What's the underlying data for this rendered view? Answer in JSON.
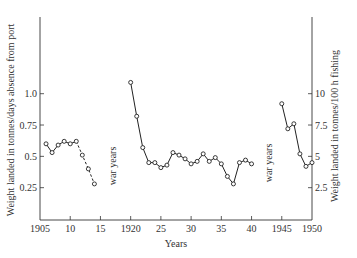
{
  "chart_data": {
    "type": "line",
    "title": "",
    "xlabel": "Years",
    "ylabel": "Weight landed in tonnes/days absence from port",
    "ylabel_right": "Weight landed in tonnes/100 h fishing",
    "xlim": [
      1905,
      1950
    ],
    "ylim": [
      0,
      1.3
    ],
    "ylim_right": [
      0,
      13
    ],
    "grid": false,
    "legend": null,
    "x_ticks": [
      {
        "value": 1905,
        "label": "1905"
      },
      {
        "value": 1910,
        "label": "10"
      },
      {
        "value": 1915,
        "label": "15"
      },
      {
        "value": 1920,
        "label": "1920"
      },
      {
        "value": 1925,
        "label": "25"
      },
      {
        "value": 1930,
        "label": "30"
      },
      {
        "value": 1935,
        "label": "35"
      },
      {
        "value": 1940,
        "label": "40"
      },
      {
        "value": 1945,
        "label": "1945"
      },
      {
        "value": 1950,
        "label": "1950"
      }
    ],
    "y_ticks_left": [
      {
        "value": 0.25,
        "label": "0.25"
      },
      {
        "value": 0.5,
        "label": "0.5"
      },
      {
        "value": 0.75,
        "label": "0.75"
      },
      {
        "value": 1.0,
        "label": "1.0"
      }
    ],
    "y_ticks_right": [
      {
        "value": 2.5,
        "label": "2.5"
      },
      {
        "value": 5,
        "label": "5"
      },
      {
        "value": 7.5,
        "label": "7.5"
      },
      {
        "value": 10,
        "label": "10"
      }
    ],
    "annotations": [
      {
        "text": "war years",
        "x": 1916.5,
        "y": 0.35,
        "rotation": -90
      },
      {
        "text": "war years",
        "x": 1942.5,
        "y": 0.5,
        "rotation": -90
      }
    ],
    "series": [
      {
        "name": "1906-1914 (tonnes/days absence from port)",
        "axis": "left",
        "x": [
          1906,
          1907,
          1908,
          1909,
          1910,
          1911,
          1912,
          1913,
          1914
        ],
        "values": [
          0.6,
          0.53,
          0.59,
          0.62,
          0.6,
          0.62,
          0.51,
          0.4,
          0.28
        ],
        "style": "solid-then-dashed",
        "dashed_from_index": 5
      },
      {
        "name": "1920-1940 (tonnes/days absence from port)",
        "axis": "left",
        "x": [
          1920,
          1921,
          1922,
          1923,
          1924,
          1925,
          1926,
          1927,
          1928,
          1929,
          1930,
          1931,
          1932,
          1933,
          1934,
          1935,
          1936,
          1937,
          1938,
          1939,
          1940
        ],
        "values": [
          1.09,
          0.82,
          0.57,
          0.45,
          0.45,
          0.41,
          0.43,
          0.53,
          0.51,
          0.48,
          0.44,
          0.46,
          0.52,
          0.46,
          0.49,
          0.44,
          0.34,
          0.28,
          0.45,
          0.47,
          0.44
        ],
        "style": "solid"
      },
      {
        "name": "1945-1950 (tonnes/100 h fishing)",
        "axis": "right",
        "x": [
          1945,
          1946,
          1947,
          1948,
          1949,
          1950
        ],
        "values": [
          9.2,
          7.2,
          7.6,
          5.2,
          4.2,
          4.5
        ],
        "style": "solid"
      }
    ]
  },
  "labels": {
    "xlabel": "Years",
    "ylabel_left": "Weight landed in tonnes/days absence from port",
    "ylabel_right": "Weight landed in tonnes/100 h fishing",
    "war_years_1": "war years",
    "war_years_2": "war years"
  }
}
